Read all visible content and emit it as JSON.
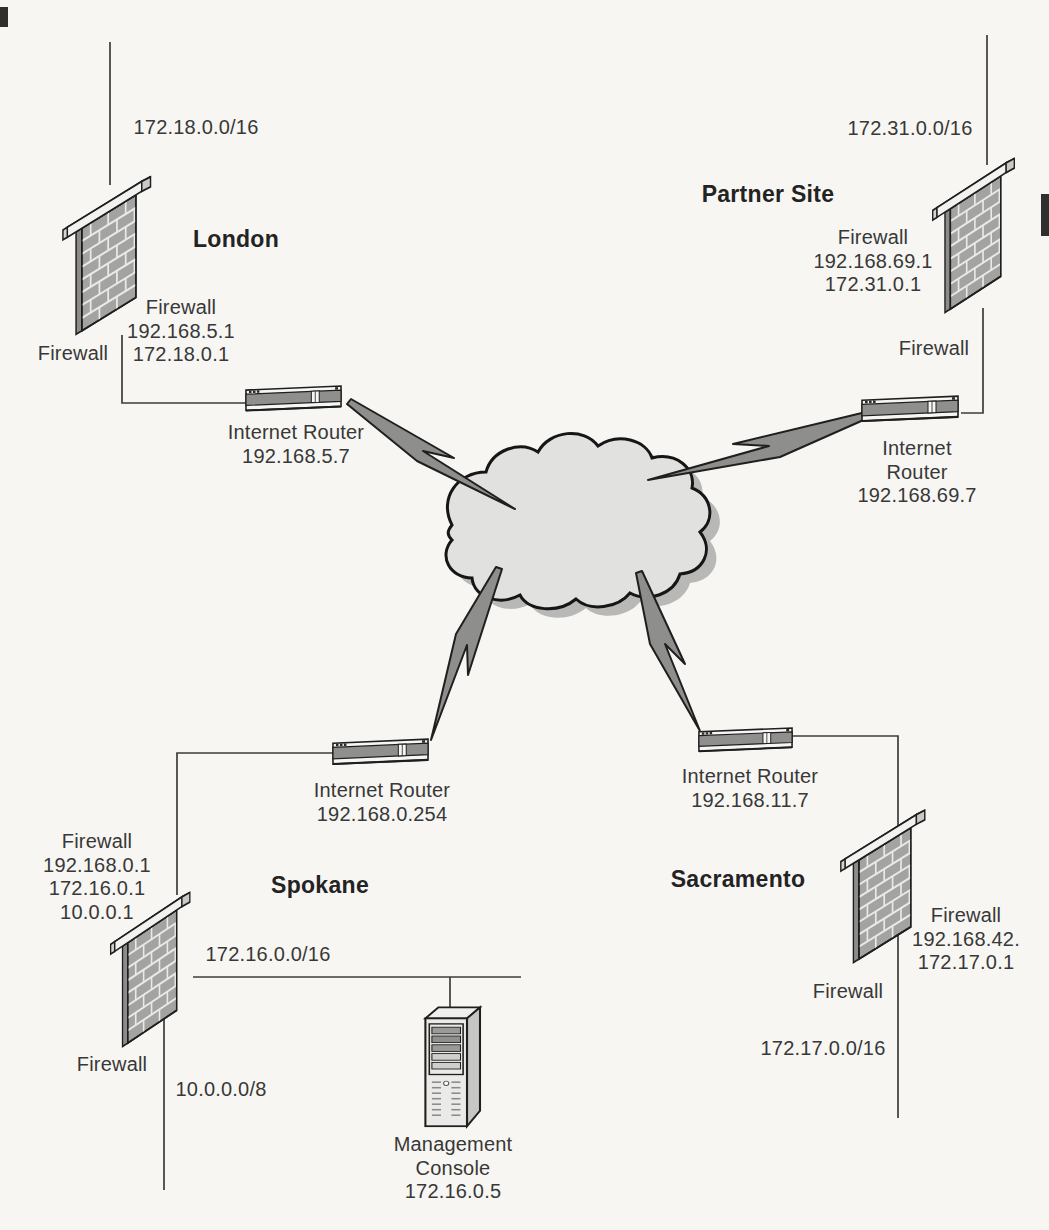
{
  "diagram_title": "VPN site-to-site network diagram",
  "colors": {
    "background": "#f7f6f3",
    "ink": "#383838",
    "connector_line": "#3c3c3c",
    "brick_fill": "#a3a3a1",
    "cloud_fill": "#e1e1df",
    "cloud_shadow": "#b8b8b6",
    "bolt_fill": "#8e8e8c",
    "outline": "#1f1f1f"
  },
  "icons": {
    "firewall": "brick-wall-icon",
    "router": "router-box-icon",
    "cloud": "internet-cloud-icon",
    "bolt": "lightning-bolt-icon",
    "server": "server-tower-icon"
  },
  "sites": {
    "london": {
      "name": "London",
      "network_label": "172.18.0.0/16",
      "firewall_info": "Firewall\n192.168.5.1\n172.18.0.1",
      "firewall_caption": "Firewall",
      "router_info": "Internet Router\n192.168.5.7"
    },
    "partner": {
      "name": "Partner Site",
      "network_label": "172.31.0.0/16",
      "firewall_info": "Firewall\n192.168.69.1\n172.31.0.1",
      "firewall_caption": "Firewall",
      "router_info": "Internet Router\n192.168.69.7"
    },
    "spokane": {
      "name": "Spokane",
      "network_label": "172.16.0.0/16",
      "second_network_label": "10.0.0.0/8",
      "firewall_info": "Firewall\n192.168.0.1\n172.16.0.1\n10.0.0.1",
      "firewall_caption": "Firewall",
      "router_info": "Internet Router\n192.168.0.254",
      "management_console_label": "Management\nConsole\n172.16.0.5"
    },
    "sacramento": {
      "name": "Sacramento",
      "network_label": "172.17.0.0/16",
      "firewall_info": "Firewall\n192.168.42.\n172.17.0.1",
      "firewall_caption": "Firewall",
      "router_info": "Internet Router\n192.168.11.7"
    }
  }
}
